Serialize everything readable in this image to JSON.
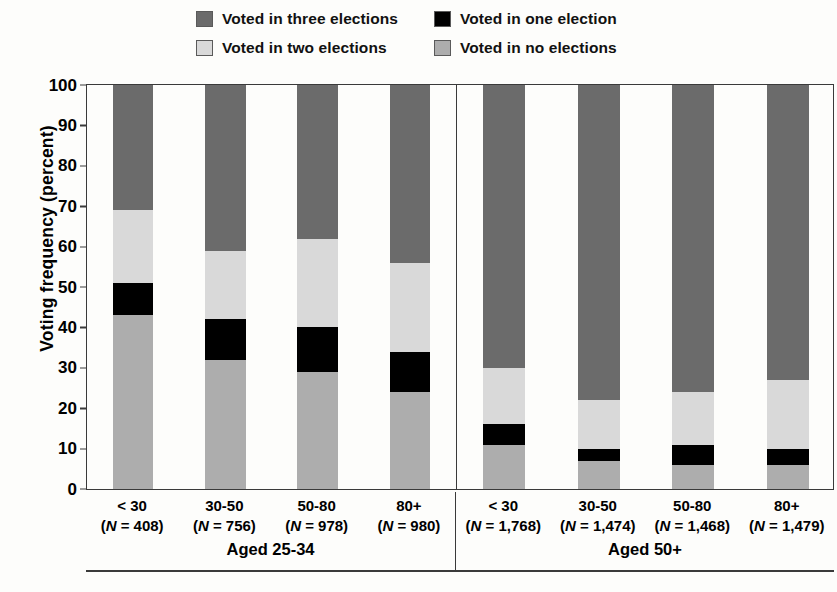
{
  "chart_data": {
    "type": "bar",
    "subtype": "stacked-bar-100-percent",
    "title": "",
    "xlabel": "",
    "ylabel": "Voting frequency (percent)",
    "ylim": [
      0,
      100
    ],
    "ytick_step": 10,
    "yticks": [
      100,
      90,
      80,
      70,
      60,
      50,
      40,
      30,
      20,
      10,
      0
    ],
    "grid": false,
    "legend_position": "top",
    "stack_order_bottom_to_top": [
      "Voted in no elections",
      "Voted in one election",
      "Voted in two elections",
      "Voted in three elections"
    ],
    "legend": [
      {
        "label": "Voted in three elections",
        "color": "#6b6b6b",
        "key": "three"
      },
      {
        "label": "Voted in one election",
        "color": "#000000",
        "key": "one"
      },
      {
        "label": "Voted in two elections",
        "color": "#d9d9d9",
        "key": "two"
      },
      {
        "label": "Voted in no elections",
        "color": "#adadad",
        "key": "none"
      }
    ],
    "panels": [
      {
        "group_title": "Aged 25-34",
        "categories": [
          "< 30",
          "30-50",
          "50-80",
          "80+"
        ],
        "n_labels": [
          "(N = 408)",
          "(N = 756)",
          "(N = 978)",
          "(N = 980)"
        ],
        "n_values": [
          408,
          756,
          978,
          980
        ],
        "series": [
          {
            "name": "Voted in no elections",
            "values": [
              43,
              32,
              29,
              24
            ]
          },
          {
            "name": "Voted in one election",
            "values": [
              8,
              10,
              11,
              10
            ]
          },
          {
            "name": "Voted in two elections",
            "values": [
              18,
              17,
              22,
              22
            ]
          },
          {
            "name": "Voted in three elections",
            "values": [
              31,
              41,
              38,
              44
            ]
          }
        ],
        "cumulative_tops": [
          {
            "none": 43,
            "one": 51,
            "two": 69,
            "three": 100
          },
          {
            "none": 32,
            "one": 42,
            "two": 59,
            "three": 100
          },
          {
            "none": 29,
            "one": 40,
            "two": 62,
            "three": 100
          },
          {
            "none": 24,
            "one": 34,
            "two": 56,
            "three": 100
          }
        ]
      },
      {
        "group_title": "Aged 50+",
        "categories": [
          "< 30",
          "30-50",
          "50-80",
          "80+"
        ],
        "n_labels": [
          "(N = 1,768)",
          "(N = 1,474)",
          "(N = 1,468)",
          "(N = 1,479)"
        ],
        "n_values": [
          1768,
          1474,
          1468,
          1479
        ],
        "series": [
          {
            "name": "Voted in no elections",
            "values": [
              11,
              7,
              6,
              6
            ]
          },
          {
            "name": "Voted in one election",
            "values": [
              5,
              3,
              5,
              4
            ]
          },
          {
            "name": "Voted in two elections",
            "values": [
              14,
              12,
              13,
              17
            ]
          },
          {
            "name": "Voted in three elections",
            "values": [
              70,
              78,
              76,
              73
            ]
          }
        ],
        "cumulative_tops": [
          {
            "none": 11,
            "one": 16,
            "two": 30,
            "three": 100
          },
          {
            "none": 7,
            "one": 10,
            "two": 22,
            "three": 100
          },
          {
            "none": 6,
            "one": 11,
            "two": 24,
            "three": 100
          },
          {
            "none": 6,
            "one": 10,
            "two": 27,
            "three": 100
          }
        ]
      }
    ]
  },
  "colors": {
    "three": "#6b6b6b",
    "two": "#d9d9d9",
    "one": "#000000",
    "none": "#adadad",
    "axis": "#3a3a3a",
    "background": "#fdfdfb"
  }
}
